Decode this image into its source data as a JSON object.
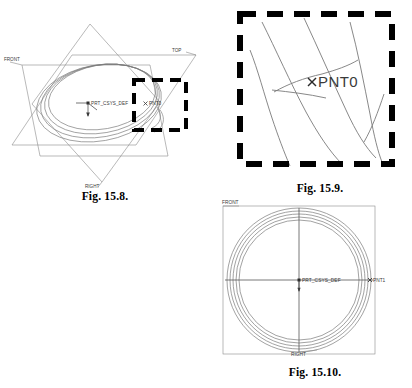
{
  "page": {
    "kind": "cad-figure-plate",
    "background_color": "#ffffff",
    "ink_color": "#000000",
    "line_color": "#6e6e6e",
    "accent_color": "#3a3a3a"
  },
  "figures": [
    {
      "id": "fig-15-8",
      "caption": "Fig. 15.8.",
      "view": "isometric",
      "description": "Three orthogonal datum planes with a helical sweep trajectory, default coordinate system and a dashed detail box.",
      "labels": {
        "front_plane": "FRONT",
        "top_plane": "TOP",
        "right_plane": "RIGHT",
        "csys": "PRT_CSYS_DEF",
        "point": "PNT0"
      },
      "detail_box": {
        "style": "dashed",
        "stroke_width": 4
      }
    },
    {
      "id": "fig-15-9",
      "caption": "Fig. 15.9.",
      "view": "detail-zoom",
      "description": "Magnified view of the dashed region from Fig. 15.8 showing the helix turns crossing and the datum point.",
      "labels": {
        "point": "PNT0"
      },
      "detail_box": {
        "style": "dashed",
        "stroke_width": 6
      }
    },
    {
      "id": "fig-15-10",
      "caption": "Fig. 15.10.",
      "view": "top",
      "description": "Top view of the spiral sweep showing concentric turns, datum axes and the end point.",
      "labels": {
        "front_plane": "FRONT",
        "right_plane": "RIGHT",
        "csys": "PRT_CSYS_DEF",
        "point": "PNT1"
      }
    }
  ]
}
